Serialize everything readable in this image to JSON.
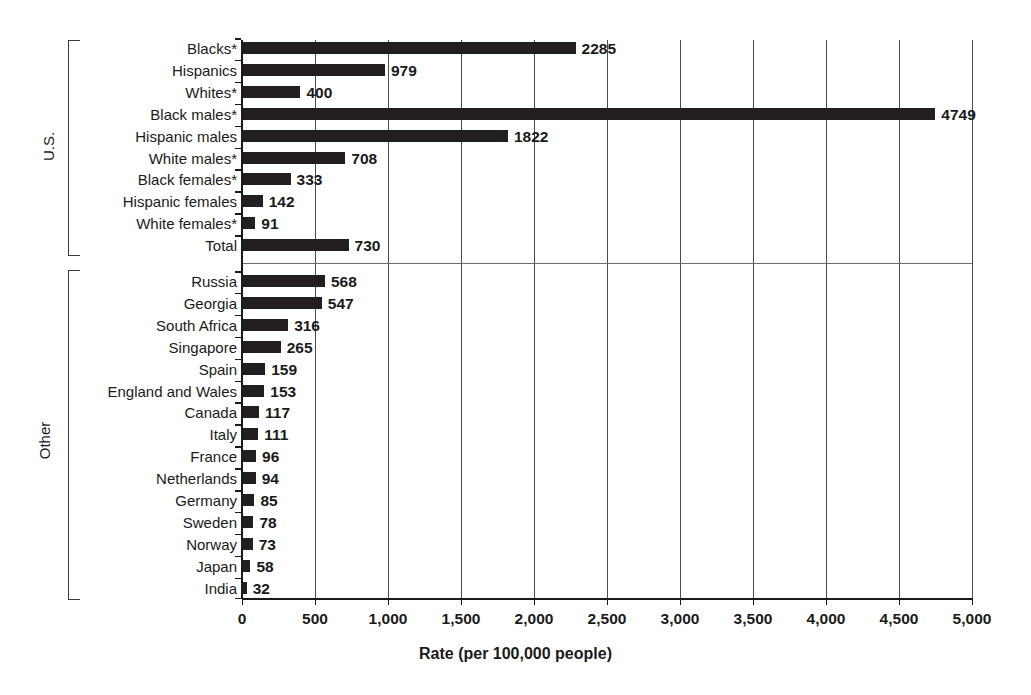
{
  "chart_data": {
    "type": "bar",
    "orientation": "horizontal",
    "title": "",
    "xlabel": "Rate (per 100,000 people)",
    "ylabel": "",
    "xlim": [
      0,
      5000
    ],
    "xticks": [
      0,
      500,
      1000,
      1500,
      2000,
      2500,
      3000,
      3500,
      4000,
      4500,
      5000
    ],
    "xtick_labels": [
      "0",
      "500",
      "1,000",
      "1,500",
      "2,000",
      "2,500",
      "3,000",
      "3,500",
      "4,000",
      "4,500",
      "5,000"
    ],
    "grid": "vertical",
    "legend": "none",
    "groups": [
      {
        "name": "U.S.",
        "label": "U.S.",
        "categories": [
          "Blacks*",
          "Hispanics",
          "Whites*",
          "Black males*",
          "Hispanic males",
          "White males*",
          "Black females*",
          "Hispanic females",
          "White females*",
          "Total"
        ],
        "values": [
          2285,
          979,
          400,
          4749,
          1822,
          708,
          333,
          142,
          91,
          730
        ]
      },
      {
        "name": "Other",
        "label": "Other",
        "categories": [
          "Russia",
          "Georgia",
          "South Africa",
          "Singapore",
          "Spain",
          "England and Wales",
          "Canada",
          "Italy",
          "France",
          "Netherlands",
          "Germany",
          "Sweden",
          "Norway",
          "Japan",
          "India"
        ],
        "values": [
          568,
          547,
          316,
          265,
          159,
          153,
          117,
          111,
          96,
          94,
          85,
          78,
          73,
          58,
          32
        ]
      }
    ],
    "categories": [
      "Blacks*",
      "Hispanics",
      "Whites*",
      "Black males*",
      "Hispanic males",
      "White males*",
      "Black females*",
      "Hispanic females",
      "White females*",
      "Total",
      "Russia",
      "Georgia",
      "South Africa",
      "Singapore",
      "Spain",
      "England and Wales",
      "Canada",
      "Italy",
      "France",
      "Netherlands",
      "Germany",
      "Sweden",
      "Norway",
      "Japan",
      "India"
    ],
    "values": [
      2285,
      979,
      400,
      4749,
      1822,
      708,
      333,
      142,
      91,
      730,
      568,
      547,
      316,
      265,
      159,
      153,
      117,
      111,
      96,
      94,
      85,
      78,
      73,
      58,
      32
    ],
    "bar_color": "#231f20"
  },
  "caption": {
    "text": ""
  }
}
